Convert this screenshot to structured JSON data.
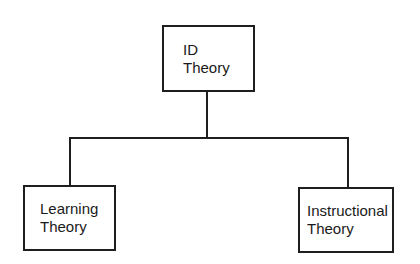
{
  "diagram": {
    "type": "hierarchy",
    "nodes": [
      {
        "id": "root",
        "line1": "ID",
        "line2": "Theory"
      },
      {
        "id": "left",
        "line1": "Learning",
        "line2": "Theory"
      },
      {
        "id": "right",
        "line1": "Instructional",
        "line2": "Theory"
      }
    ],
    "edges": [
      {
        "from": "root",
        "to": "left"
      },
      {
        "from": "root",
        "to": "right"
      }
    ]
  }
}
